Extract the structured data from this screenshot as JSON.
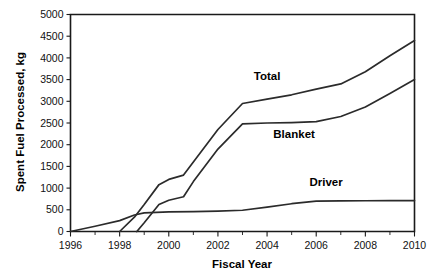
{
  "chart_data": {
    "type": "line",
    "title": "",
    "xlabel": "Fiscal Year",
    "ylabel": "Spent Fuel Processed, kg",
    "xlim": [
      1996,
      2010
    ],
    "ylim": [
      0,
      5000
    ],
    "xtick_step": 2,
    "ytick_step": 500,
    "grid": false,
    "legend_position": "inline-annotations",
    "xticks": [
      "1996",
      "1998",
      "2000",
      "2002",
      "2004",
      "2006",
      "2008",
      "2010"
    ],
    "yticks": [
      "0",
      "500",
      "1000",
      "1500",
      "2000",
      "2500",
      "3000",
      "3500",
      "4000",
      "4500",
      "5000"
    ],
    "series": [
      {
        "name": "Total",
        "label": "Total",
        "color": "#2b2b2b",
        "x": [
          1998.0,
          1998.6,
          1999.0,
          1999.6,
          2000.0,
          2000.6,
          2001.0,
          2002.0,
          2003.0,
          2004.0,
          2005.0,
          2006.0,
          2007.0,
          2008.0,
          2009.0,
          2010.0
        ],
        "values": [
          0,
          330,
          620,
          1080,
          1200,
          1300,
          1600,
          2350,
          2950,
          3050,
          3150,
          3280,
          3400,
          3680,
          4050,
          4400
        ]
      },
      {
        "name": "Blanket",
        "label": "Blanket",
        "color": "#2b2b2b",
        "x": [
          1998.7,
          1999.0,
          1999.6,
          2000.0,
          2000.6,
          2001.0,
          2002.0,
          2003.0,
          2004.0,
          2005.0,
          2006.0,
          2007.0,
          2008.0,
          2009.0,
          2010.0
        ],
        "values": [
          0,
          200,
          620,
          720,
          800,
          1150,
          1900,
          2480,
          2500,
          2510,
          2530,
          2650,
          2870,
          3180,
          3500
        ]
      },
      {
        "name": "Driver",
        "label": "Driver",
        "color": "#2b2b2b",
        "x": [
          1996.0,
          1997.0,
          1998.0,
          1998.6,
          1999.0,
          2000.0,
          2001.0,
          2002.0,
          2003.0,
          2004.0,
          2005.0,
          2006.0,
          2007.0,
          2008.0,
          2009.0,
          2010.0
        ],
        "values": [
          0,
          120,
          250,
          380,
          430,
          450,
          460,
          470,
          490,
          560,
          640,
          700,
          705,
          708,
          710,
          712
        ]
      }
    ],
    "annotations": [
      {
        "text": "Total",
        "x": 2004.0,
        "y": 3480
      },
      {
        "text": "Blanket",
        "x": 2005.1,
        "y": 2150
      },
      {
        "text": "Driver",
        "x": 2006.4,
        "y": 1050
      }
    ]
  }
}
